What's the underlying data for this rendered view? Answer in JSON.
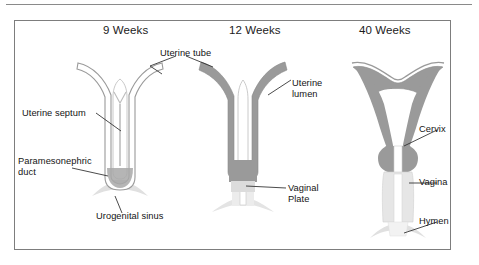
{
  "figure": {
    "type": "medical-diagram",
    "colors": {
      "wall_gray": "#9a9a9a",
      "light_gray": "#d6d6d6",
      "outline_gray": "#8f8f8f",
      "lumen_white": "#ffffff",
      "border": "#7d7d7d",
      "text": "#141414"
    },
    "stages": [
      {
        "id": "stage-9-weeks",
        "title": "9 Weeks"
      },
      {
        "id": "stage-12-weeks",
        "title": "12 Weeks"
      },
      {
        "id": "stage-40-weeks",
        "title": "40 Weeks"
      }
    ],
    "labels": [
      {
        "id": "uterine-tube",
        "text": "Uterine tube",
        "stage": "shared-9-12"
      },
      {
        "id": "uterine-septum",
        "text": "Uterine septum",
        "stage": "9 Weeks"
      },
      {
        "id": "paramesonephric-duct",
        "text": "Paramesonephric",
        "text2": "duct",
        "stage": "9 Weeks"
      },
      {
        "id": "urogenital-sinus",
        "text": "Urogenital sinus",
        "stage": "9 Weeks"
      },
      {
        "id": "uterine-lumen",
        "text": "Uterine",
        "text2": "lumen",
        "stage": "12 Weeks"
      },
      {
        "id": "vaginal-plate",
        "text": "Vaginal",
        "text2": "Plate",
        "stage": "12 Weeks"
      },
      {
        "id": "cervix",
        "text": "Cervix",
        "stage": "40 Weeks"
      },
      {
        "id": "vagina",
        "text": "Vagina",
        "stage": "40 Weeks"
      },
      {
        "id": "hymen",
        "text": "Hymen",
        "stage": "40 Weeks"
      }
    ]
  }
}
